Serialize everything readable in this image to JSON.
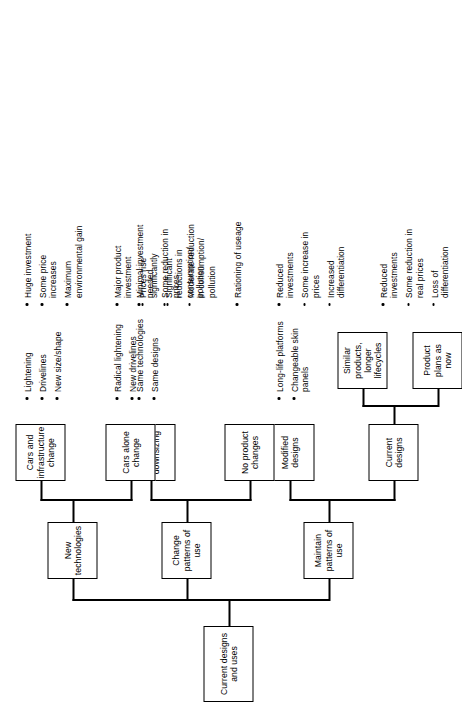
{
  "diagram": {
    "root": {
      "label": "Current designs and uses"
    },
    "branches": [
      {
        "id": "maintain",
        "label": "Maintain patterns of use"
      },
      {
        "id": "change",
        "label": "Change patterns of use"
      },
      {
        "id": "newtech",
        "label": "New technologies"
      }
    ],
    "nodes": {
      "current_designs": "Current designs",
      "modified_designs": "Modified designs",
      "no_product_changes": "No product changes",
      "general_downsizing": "General downsizing",
      "cars_alone_change": "Cars alone change",
      "cars_and_infrastructure_change": "Cars and infrastructure change",
      "product_plans_as_now": "Product plans as now",
      "similar_products_longer_lifecycles": "Similar products, longer lifecycles"
    },
    "bullet_groups": [
      {
        "id": "current-designs-features",
        "items": [
          "Reduced investments",
          "Some reduction in real prices",
          "Loss of differentiation"
        ]
      },
      {
        "id": "modified-designs-features",
        "items": [
          "Long-life platforms",
          "Changeable skin panels"
        ]
      },
      {
        "id": "modified-designs-outcomes",
        "items": [
          "Reduced investments",
          "Some increase in prices",
          "Increased differentiation"
        ]
      },
      {
        "id": "no-product-changes-features",
        "items": [
          "Rationing of useage"
        ]
      },
      {
        "id": "general-downsizing-features",
        "items": [
          "Same technologies",
          "Same designs"
        ]
      },
      {
        "id": "downsizing-outcomes",
        "items": [
          "Minimal investment needed",
          "Some reduction in prices",
          "Moderate reduction in consumption/\npollution"
        ]
      },
      {
        "id": "cars-alone-features",
        "items": [
          "Radical lightening",
          "New drivelines"
        ]
      },
      {
        "id": "cars-alone-outcomes",
        "items": [
          "Major product investment",
          "Prices rise significantly",
          "Significant reductions in consumption/\npollution"
        ]
      },
      {
        "id": "cars-infrastructure-features",
        "items": [
          "Lightening",
          "Drivelines",
          "New size/shape"
        ]
      },
      {
        "id": "cars-infrastructure-outcomes",
        "items": [
          "Huge investment",
          "Some price increases",
          "Maximum environmental gain"
        ]
      }
    ]
  }
}
